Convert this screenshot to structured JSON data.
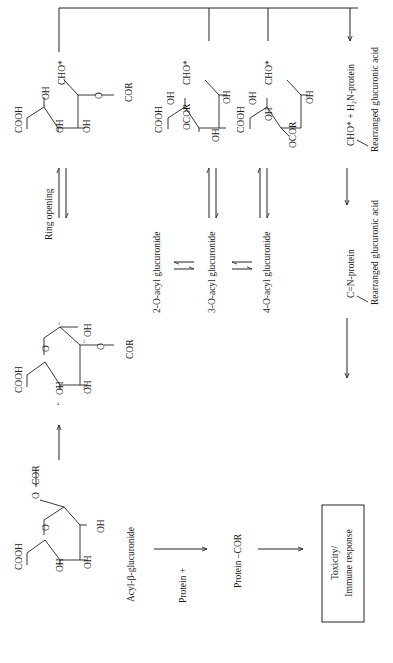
{
  "diagram": {
    "orientation": "rotated 90deg counter-clockwise",
    "nodes": {
      "acyl_beta": {
        "label": "Acyl-β-glucuronide",
        "groups": {
          "cooh": "COOH",
          "oh1": "OH",
          "oh2": "OH",
          "oh3": "OH",
          "o_ring": "O",
          "o_link": "O",
          "cor": "COR"
        }
      },
      "glucuronide_2": {
        "groups": {
          "cooh": "COOH",
          "oh1": "OH",
          "oh2": "OH",
          "oh_anomeric": "OH",
          "o_ring": "O",
          "o_link": "O",
          "cor": "COR"
        },
        "atom_numbers": [
          "1",
          "2",
          "3",
          "4"
        ]
      },
      "ring_opening": {
        "label": "Ring opening"
      },
      "open_chain_2": {
        "groups": {
          "cooh": "COOH",
          "oh_a": "OH",
          "oh_b": "OH",
          "oh_c": "OH",
          "cho": "CHO*",
          "o_link": "O",
          "cor": "COR"
        }
      },
      "open_chain_3": {
        "groups": {
          "cooh": "COOH",
          "oh_a": "OH",
          "ocor": "OCOR",
          "oh_b": "OH",
          "oh_c": "OH",
          "cho": "CHO*"
        }
      },
      "open_chain_4": {
        "groups": {
          "cooh": "COOH",
          "oh_a": "OH",
          "oh_b": "OH",
          "ocor": "OCOR",
          "oh_c": "OH",
          "cho": "CHO*"
        }
      },
      "isomers": {
        "two": "2-O-acyl glucuronide",
        "three": "3-O-acyl glucuronide",
        "four": "4-O-acyl glucuronide"
      },
      "transacylation": {
        "protein_plus": "Protein +",
        "protein_cor": "Protein –COR"
      },
      "glycation": {
        "cho_protein": "CHO* + H₂N-protein",
        "rearranged_1": "Rearranged glucuronic acid",
        "imine": "C=N-protein",
        "rearranged_2": "Rearranged glucuronic acid"
      },
      "outcome": {
        "line1": "Toxicity/",
        "line2": "Immune response"
      }
    }
  }
}
